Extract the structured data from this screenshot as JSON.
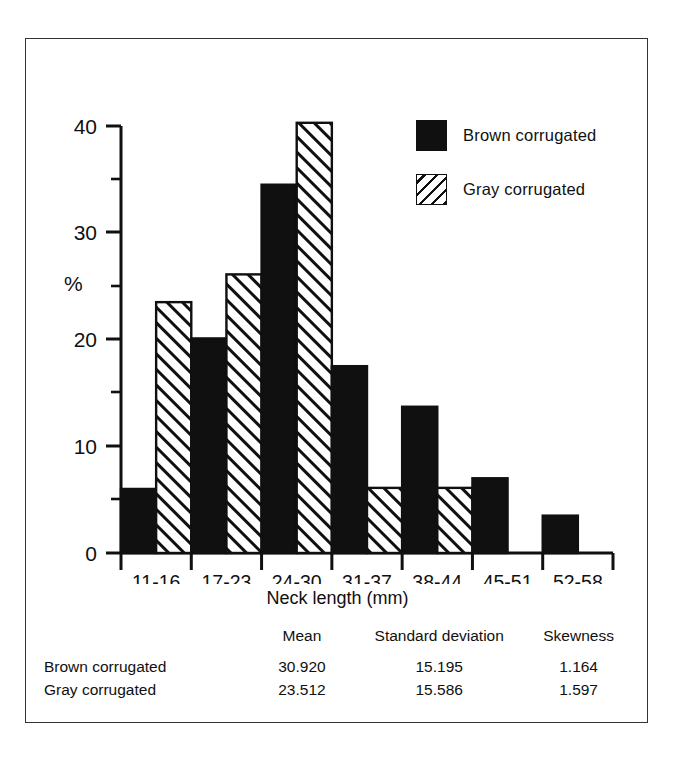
{
  "chart_data": {
    "type": "bar",
    "title": "",
    "xlabel": "Neck length (mm)",
    "ylabel": "%",
    "ylim": [
      0,
      40
    ],
    "yticks": [
      0,
      10,
      20,
      30,
      40
    ],
    "ytick_labels": [
      "0",
      "10",
      "20",
      "30",
      "40"
    ],
    "yminor_ticks": [
      5,
      15,
      25,
      35
    ],
    "grid": false,
    "legend_position": "upper right",
    "categories": [
      "11-16",
      "17-23",
      "24-30",
      "31-37",
      "38-44",
      "45-51",
      "52-58"
    ],
    "series": [
      {
        "name": "Brown corrugated",
        "fill": "solid",
        "color": "#101010",
        "values": [
          6.0,
          20.1,
          34.5,
          17.5,
          13.7,
          7.0,
          3.5
        ]
      },
      {
        "name": "Gray corrugated",
        "fill": "hatched",
        "color": "#101010",
        "values": [
          23.5,
          26.1,
          40.3,
          6.1,
          6.1,
          0,
          0
        ]
      }
    ]
  },
  "legend": {
    "items": [
      {
        "label": "Brown corrugated",
        "swatch": "solid-black-square"
      },
      {
        "label": "Gray corrugated",
        "swatch": "diagonal-hatched-square"
      }
    ]
  },
  "axes": {
    "y_axis_label": "%",
    "x_axis_label": "Neck length (mm)",
    "y_tick_labels": [
      "40",
      "30",
      "20",
      "10",
      "0"
    ],
    "x_tick_labels": [
      "11-16",
      "17-23",
      "24-30",
      "31-37",
      "38-44",
      "45-51",
      "52-58"
    ]
  },
  "stats_table": {
    "headers": [
      "",
      "Mean",
      "Standard deviation",
      "Skewness"
    ],
    "rows": [
      {
        "name": "Brown corrugated",
        "mean": "30.920",
        "sd": "15.195",
        "skewness": "1.164"
      },
      {
        "name": "Gray corrugated",
        "mean": "23.512",
        "sd": "15.586",
        "skewness": "1.597"
      }
    ]
  }
}
